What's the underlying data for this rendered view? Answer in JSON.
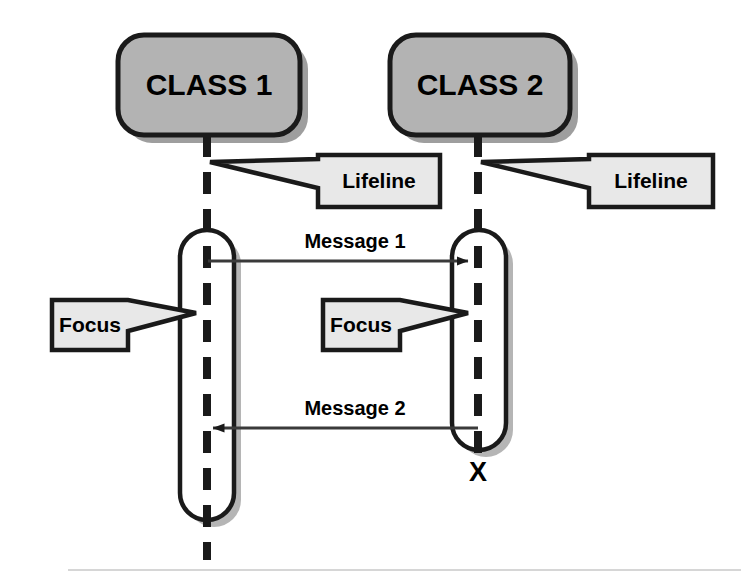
{
  "diagram": {
    "type": "uml-sequence-diagram",
    "background_color": "#ffffff",
    "colors": {
      "class_box_fill": "#b3b3b3",
      "callout_fill": "#e8e8e8",
      "activation_fill": "#ffffff",
      "stroke": "#1a1a1a",
      "shadow": "#9e9e9e",
      "footer_rule": "#c9c9c9"
    },
    "classes": [
      {
        "id": "class-1",
        "label": "CLASS 1",
        "x": 118,
        "y": 35,
        "width": 182,
        "height": 100,
        "lifeline_x": 207
      },
      {
        "id": "class-2",
        "label": "CLASS 2",
        "x": 390,
        "y": 35,
        "width": 180,
        "height": 100,
        "lifeline_x": 478
      }
    ],
    "lifelines": [
      {
        "id": "lifeline-1",
        "owner": "CLASS 1",
        "x": 207,
        "y_start": 135,
        "y_end": 560
      },
      {
        "id": "lifeline-2",
        "owner": "CLASS 2",
        "x": 478,
        "y_start": 135,
        "y_end": 466
      }
    ],
    "activations": [
      {
        "id": "focus-1",
        "owner": "CLASS 1",
        "x": 180,
        "y": 230,
        "width": 54,
        "height": 290
      },
      {
        "id": "focus-2",
        "owner": "CLASS 2",
        "x": 452,
        "y": 230,
        "width": 54,
        "height": 220
      }
    ],
    "messages": [
      {
        "id": "message-1",
        "label": "Message 1",
        "from": "CLASS 1",
        "to": "CLASS 2",
        "direction": "right",
        "y": 261,
        "x_start": 208,
        "x_end": 476,
        "label_x": 355,
        "label_y": 243
      },
      {
        "id": "message-2",
        "label": "Message 2",
        "from": "CLASS 2",
        "to": "CLASS 1",
        "direction": "left",
        "y": 428,
        "x_start": 478,
        "x_end": 205,
        "label_x": 355,
        "label_y": 410
      }
    ],
    "callouts": [
      {
        "id": "callout-lifeline-1",
        "label": "Lifeline",
        "tail": "left",
        "x": 300,
        "y": 155,
        "width": 140,
        "height": 52,
        "tail_tip_x": 210,
        "tail_tip_y": 162
      },
      {
        "id": "callout-lifeline-2",
        "label": "Lifeline",
        "tail": "left",
        "x": 573,
        "y": 155,
        "width": 140,
        "height": 52,
        "tail_tip_x": 481,
        "tail_tip_y": 162
      },
      {
        "id": "callout-focus-1",
        "label": "Focus",
        "tail": "right",
        "x": 52,
        "y": 300,
        "width": 96,
        "height": 50,
        "tail_tip_x": 196,
        "tail_tip_y": 313
      },
      {
        "id": "callout-focus-2",
        "label": "Focus",
        "tail": "right",
        "x": 323,
        "y": 300,
        "width": 96,
        "height": 50,
        "tail_tip_x": 468,
        "tail_tip_y": 313
      }
    ],
    "termination": {
      "id": "termination-mark",
      "label": "X",
      "owner": "CLASS 2",
      "x": 478,
      "y": 472
    },
    "footer_rule": {
      "x1": 68,
      "x2": 741,
      "y": 570
    }
  }
}
